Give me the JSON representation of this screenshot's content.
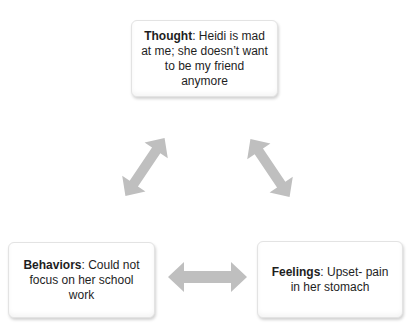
{
  "diagram": {
    "nodes": [
      {
        "id": "thought",
        "label": "Thought",
        "text": ": Heidi is mad at me; she doesn’t want to be my friend anymore"
      },
      {
        "id": "behaviors",
        "label": "Behaviors",
        "text": ": Could not focus on her school work"
      },
      {
        "id": "feelings",
        "label": "Feelings",
        "text": ": Upset- pain in her stomach"
      }
    ],
    "edges": [
      {
        "from": "thought",
        "to": "behaviors",
        "type": "bidirectional-arrow"
      },
      {
        "from": "thought",
        "to": "feelings",
        "type": "bidirectional-arrow"
      },
      {
        "from": "behaviors",
        "to": "feelings",
        "type": "bidirectional-arrow"
      }
    ],
    "colors": {
      "arrow": "#bfbfbf",
      "text": "#1e1e1e",
      "box_border": "#e3e3e3",
      "background": "#ffffff"
    }
  }
}
